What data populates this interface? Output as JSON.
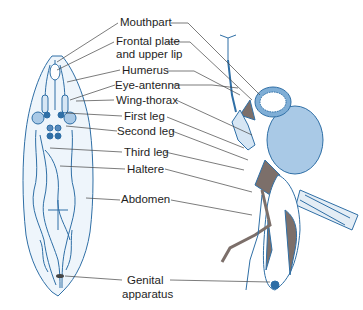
{
  "figure": {
    "type": "anatomical-diagram",
    "labels": [
      {
        "id": "mouthpart",
        "text": "Mouthpart"
      },
      {
        "id": "frontal_plate_1",
        "text": "Frontal plate"
      },
      {
        "id": "frontal_plate_2",
        "text": "and upper lip"
      },
      {
        "id": "humerus",
        "text": "Humerus"
      },
      {
        "id": "eye_antenna",
        "text": "Eye-antenna"
      },
      {
        "id": "wing_thorax",
        "text": "Wing-thorax"
      },
      {
        "id": "first_leg",
        "text": "First leg"
      },
      {
        "id": "second_leg",
        "text": "Second leg"
      },
      {
        "id": "third_leg",
        "text": "Third leg"
      },
      {
        "id": "haltere",
        "text": "Haltere"
      },
      {
        "id": "abdomen",
        "text": "Abdomen"
      },
      {
        "id": "genital_1",
        "text": "Genital"
      },
      {
        "id": "genital_2",
        "text": "apparatus"
      }
    ],
    "colors": {
      "outline": "#2f6fa6",
      "light_blue": "#a9c9e6",
      "mid_blue": "#7faed6",
      "gray_brown": "#7c6f6a",
      "leader": "#444444"
    }
  }
}
